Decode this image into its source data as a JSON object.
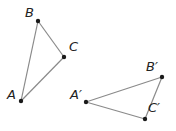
{
  "diagram": {
    "title": "",
    "colors": {
      "edge": "#8a8a8a",
      "point": "#1a1a1a",
      "label": "#222222",
      "background": "#ffffff"
    },
    "triangles": [
      {
        "name": "ABC",
        "vertices": [
          {
            "label": "A",
            "x": 21,
            "y": 101
          },
          {
            "label": "B",
            "x": 38,
            "y": 21
          },
          {
            "label": "C",
            "x": 64,
            "y": 57
          }
        ]
      },
      {
        "name": "A'B'C'",
        "vertices": [
          {
            "label": "A′",
            "x": 86,
            "y": 102
          },
          {
            "label": "B′",
            "x": 162,
            "y": 77
          },
          {
            "label": "C′",
            "x": 145,
            "y": 119
          }
        ]
      }
    ],
    "labels": {
      "A": "A",
      "B": "B",
      "C": "C",
      "A1": "A′",
      "B1": "B′",
      "C1": "C′"
    }
  }
}
